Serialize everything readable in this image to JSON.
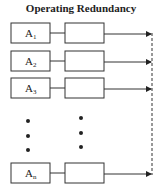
{
  "title": "Operating Redundancy",
  "rows": [
    {
      "label": "A",
      "subscript": "1",
      "y": 23
    },
    {
      "label": "A",
      "subscript": "2",
      "y": 51
    },
    {
      "label": "A",
      "subscript": "3",
      "y": 78
    },
    {
      "label": "A",
      "subscript": "n",
      "y": 163
    }
  ],
  "ellipsis": {
    "col1_x": 28,
    "col2_x": 81,
    "col1_y": [
      121,
      136,
      150
    ],
    "col2_y": [
      118,
      133,
      147
    ]
  },
  "colors": {
    "stroke": "#333333",
    "text": "#222222",
    "background": "#ffffff"
  }
}
